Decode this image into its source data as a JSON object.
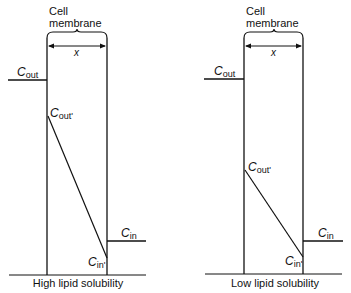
{
  "panels": [
    {
      "id": "high",
      "header_line1": "Cell",
      "header_line2": "membrane",
      "thickness_label": "x",
      "c_out_symbol": "C",
      "c_out_sub": "out",
      "c_out_prime_symbol": "C",
      "c_out_prime_sub": "out'",
      "c_in_symbol": "C",
      "c_in_sub": "in",
      "c_in_prime_symbol": "C",
      "c_in_prime_sub": "in'",
      "caption": "High lipid solubility"
    },
    {
      "id": "low",
      "header_line1": "Cell",
      "header_line2": "membrane",
      "thickness_label": "x",
      "c_out_symbol": "C",
      "c_out_sub": "out",
      "c_out_prime_symbol": "C",
      "c_out_prime_sub": "out'",
      "c_in_symbol": "C",
      "c_in_sub": "in",
      "c_in_prime_symbol": "C",
      "c_in_prime_sub": "in'",
      "caption": "Low lipid solubility"
    }
  ],
  "colors": {
    "line": "#111111",
    "background": "#ffffff"
  }
}
